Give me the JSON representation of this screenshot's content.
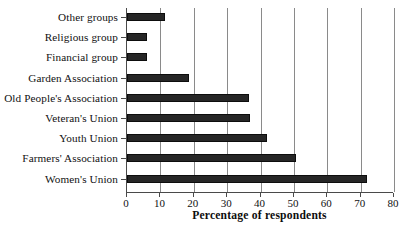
{
  "chart_data": {
    "type": "bar",
    "orientation": "horizontal",
    "title": "",
    "xlabel": "Percentage of respondents",
    "ylabel": "",
    "xlim": [
      0,
      80
    ],
    "xticks": [
      0,
      10,
      20,
      30,
      40,
      50,
      60,
      70,
      80
    ],
    "grid": "vertical",
    "legend": "none",
    "bar_color": "#262626",
    "categories": [
      "Other groups",
      "Religious group",
      "Financial group",
      "Garden Association",
      "Old People's Association",
      "Veteran's Union",
      "Youth Union",
      "Farmers' Association",
      "Women's Union"
    ],
    "values": [
      11.5,
      6,
      6,
      18.5,
      36.5,
      37,
      42,
      50.5,
      72
    ]
  }
}
